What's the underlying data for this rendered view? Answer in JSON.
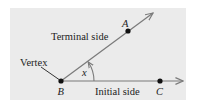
{
  "diagram": {
    "type": "angle",
    "colors": {
      "background": "#ebebeb",
      "line": "#7a7a7a",
      "point": "#111111",
      "text": "#222222"
    },
    "labels": {
      "terminal_side": "Terminal side",
      "initial_side": "Initial side",
      "vertex": "Vertex",
      "angle": "x"
    },
    "points": [
      {
        "id": "A",
        "label": "A",
        "on": "terminal side"
      },
      {
        "id": "B",
        "label": "B",
        "on": "vertex"
      },
      {
        "id": "C",
        "label": "C",
        "on": "initial side"
      }
    ]
  }
}
